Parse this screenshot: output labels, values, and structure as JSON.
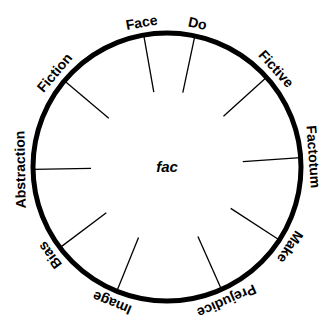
{
  "diagram": {
    "center_label": "fac",
    "spokes": [
      {
        "label": "Face",
        "angle": -100
      },
      {
        "label": "Do",
        "angle": -78
      },
      {
        "label": "Fictive",
        "angle": -42
      },
      {
        "label": "Factotum",
        "angle": -4
      },
      {
        "label": "Make",
        "angle": 33
      },
      {
        "label": "Prejudice",
        "angle": 66
      },
      {
        "label": "Image",
        "angle": 112
      },
      {
        "label": "Bias",
        "angle": 143
      },
      {
        "label": "Abstraction",
        "angle": 179
      },
      {
        "label": "Fiction",
        "angle": -140
      }
    ],
    "colors": {
      "stroke": "#000000",
      "background": "#ffffff"
    }
  }
}
